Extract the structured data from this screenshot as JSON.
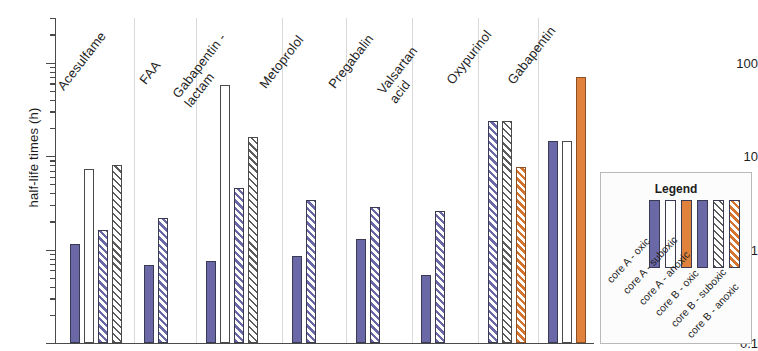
{
  "chart_data": {
    "type": "bar",
    "title": "",
    "xlabel": "",
    "ylabel": "half-life times (h)",
    "yscale": "log",
    "ylim": [
      0.1,
      300
    ],
    "ytick_labels": [
      "100",
      "10",
      "1",
      "0.1"
    ],
    "ytick_values": [
      100,
      10,
      1,
      0.1
    ],
    "grid": false,
    "legend_title": "Legend",
    "legend_position": "right",
    "categories": [
      "Acesulfame",
      "FAA",
      "Gabapentin - lactam",
      "Metoprolol",
      "Pregabalin",
      "Valsartan acid",
      "Oxypurinol",
      "Gabapentin"
    ],
    "series": [
      {
        "name": "core A - oxic",
        "fill": "purple",
        "color": "#6b68a8",
        "values": [
          1.15,
          0.68,
          0.75,
          0.85,
          1.3,
          0.53,
          null,
          14.5
        ]
      },
      {
        "name": "core A - suboxic",
        "fill": "white",
        "color": "#ffffff",
        "values": [
          7.3,
          null,
          58.0,
          null,
          null,
          null,
          null,
          14.5
        ]
      },
      {
        "name": "core A - anoxic",
        "fill": "orange",
        "color": "#e0823c",
        "values": [
          null,
          null,
          null,
          null,
          null,
          null,
          null,
          70.0
        ]
      },
      {
        "name": "core B - oxic",
        "fill": "purple-hatch",
        "color": "#6b68a8",
        "values": [
          1.62,
          2.15,
          4.5,
          3.4,
          2.85,
          2.6,
          24.0,
          null
        ]
      },
      {
        "name": "core B - suboxic",
        "fill": "white-hatch",
        "color": "#ffffff",
        "values": [
          8.0,
          null,
          16.0,
          null,
          null,
          null,
          24.0,
          null
        ]
      },
      {
        "name": "core B - anoxic",
        "fill": "orange-hatch",
        "color": "#e0823c",
        "values": [
          null,
          null,
          null,
          null,
          null,
          null,
          7.7,
          null
        ]
      }
    ]
  },
  "axis": {
    "y_title": "half-life times (h)",
    "ticks": [
      {
        "label": "100",
        "value": 100
      },
      {
        "label": "10",
        "value": 10
      },
      {
        "label": "1",
        "value": 1
      },
      {
        "label": "0.1",
        "value": 0.1
      }
    ]
  },
  "categories": [
    {
      "label": "Acesulfame",
      "line1": "Acesulfame",
      "line2": ""
    },
    {
      "label": "FAA",
      "line1": "FAA",
      "line2": ""
    },
    {
      "label": "Gabapentin - lactam",
      "line1": "Gabapentin -",
      "line2": "lactam"
    },
    {
      "label": "Metoprolol",
      "line1": "Metoprolol",
      "line2": ""
    },
    {
      "label": "Pregabalin",
      "line1": "Pregabalin",
      "line2": ""
    },
    {
      "label": "Valsartan acid",
      "line1": "Valsartan",
      "line2": "acid"
    },
    {
      "label": "Oxypurinol",
      "line1": "Oxypurinol",
      "line2": ""
    },
    {
      "label": "Gabapentin",
      "line1": "Gabapentin",
      "line2": ""
    }
  ],
  "legend": {
    "title": "Legend",
    "items": [
      {
        "label": "core A - oxic",
        "fill": "purple"
      },
      {
        "label": "core A - suboxic",
        "fill": "white"
      },
      {
        "label": "core A - anoxic",
        "fill": "orange"
      },
      {
        "label": "core B - oxic",
        "fill": "purple"
      },
      {
        "label": "core B - suboxic",
        "fill": "white-hatch"
      },
      {
        "label": "core B - anoxic",
        "fill": "orange-hatch"
      }
    ]
  },
  "colors": {
    "purple": "#6b68a8",
    "orange": "#e0823c",
    "white": "#ffffff",
    "axis": "#4a4a4a"
  }
}
